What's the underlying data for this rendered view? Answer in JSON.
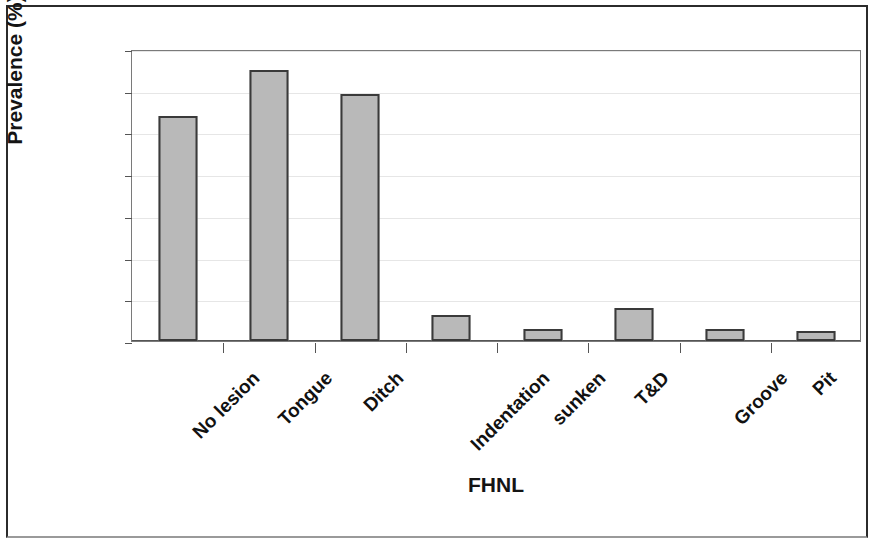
{
  "chart_data": {
    "type": "bar",
    "title": "",
    "xlabel": "FHNL",
    "ylabel": "Prevalence (%)",
    "categories": [
      "No lesion",
      "Tongue",
      "Ditch",
      "Indentation",
      "sunken",
      "T&D",
      "Groove",
      "Pit"
    ],
    "values": [
      27.0,
      32.5,
      29.6,
      3.1,
      1.5,
      4.0,
      1.5,
      1.2
    ],
    "ylim": [
      0,
      35
    ],
    "yticks": [
      0,
      5,
      10,
      15,
      20,
      25,
      30,
      35
    ],
    "ytick_labels": [
      "0",
      "5",
      "10",
      "15",
      "20",
      "25",
      "30",
      "35"
    ],
    "grid": true,
    "legend": false,
    "bar_color": "#b9b9b9",
    "bar_border_color": "#3a3a3a",
    "gridline_color": "#e6e6e6",
    "axis_color": "#555555"
  }
}
